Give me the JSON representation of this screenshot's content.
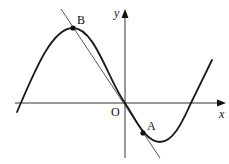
{
  "figure": {
    "labels": {
      "x_axis": "x",
      "y_axis": "y",
      "origin": "O",
      "point_a": "A",
      "point_b": "B"
    },
    "colors": {
      "curve": "#1a1a1a",
      "axes": "#333333",
      "tangent": "#444444",
      "points": "#111111"
    }
  }
}
